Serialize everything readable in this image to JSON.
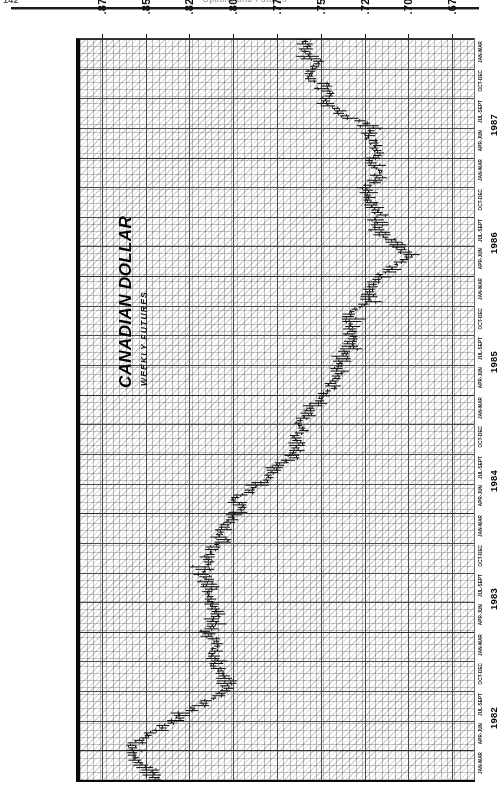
{
  "page": {
    "folio": "142",
    "header_title": "Options and Futures"
  },
  "chart": {
    "title": "CANADIAN DOLLAR",
    "subtitle": "WEEKLY FUTURES",
    "unit_label": "U.S.\n$"
  },
  "chart_data": {
    "type": "line",
    "title": "CANADIAN DOLLAR",
    "subtitle": "WEEKLY FUTURES",
    "orientation": "rotated-90",
    "xlabel": "",
    "ylabel": "U.S. $",
    "ylim": [
      0.6625,
      0.8875
    ],
    "grid": true,
    "legend": "none",
    "value_ticks": [
      ".875",
      ".850",
      ".825",
      ".800",
      ".775",
      ".750",
      ".725",
      ".700",
      ".675"
    ],
    "value_tick_numbers": [
      0.875,
      0.85,
      0.825,
      0.8,
      0.775,
      0.75,
      0.725,
      0.7,
      0.675
    ],
    "years": [
      "1982",
      "1983",
      "1984",
      "1985",
      "1986",
      "1987"
    ],
    "quarter_labels": [
      "JAN-MAR",
      "APR-JUN",
      "JUL-SEPT",
      "OCT-DEC"
    ],
    "series": [
      {
        "name": "Canadian Dollar weekly futures (OHLC bars)",
        "x": [
          "1981-Q4",
          "1982-Q1",
          "1982-Q2",
          "1982-Q3",
          "1982-Q4",
          "1983-Q1",
          "1983-Q2",
          "1983-Q3",
          "1983-Q4",
          "1984-Q1",
          "1984-Q2",
          "1984-Q3",
          "1984-Q4",
          "1985-Q1",
          "1985-Q2",
          "1985-Q3",
          "1985-Q4",
          "1986-Q1",
          "1986-Q2",
          "1986-Q3",
          "1986-Q4",
          "1987-Q1",
          "1987-Q2",
          "1987-Q3",
          "1987-Q4"
        ],
        "values": [
          0.845,
          0.855,
          0.83,
          0.805,
          0.812,
          0.814,
          0.816,
          0.812,
          0.806,
          0.8,
          0.78,
          0.762,
          0.757,
          0.742,
          0.733,
          0.731,
          0.722,
          0.7,
          0.716,
          0.722,
          0.719,
          0.723,
          0.745,
          0.758,
          0.762
        ]
      }
    ]
  }
}
